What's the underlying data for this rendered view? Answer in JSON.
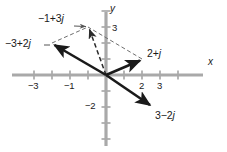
{
  "figure": {
    "axis_color": "#a8a8a8",
    "vector_color": "#1a1a1a",
    "dashed_color": "#6e6e6e",
    "text_color": "#1a1a1a"
  },
  "axes": {
    "x_label": "x",
    "y_label": "y",
    "origin_px": [
      106,
      75
    ],
    "unit_px_x": 18,
    "unit_px_y": 16,
    "xlim": [
      -4.7,
      5.2
    ],
    "ylim": [
      -4.4,
      4.2
    ],
    "x_ticks": [
      {
        "value": -4,
        "label": ""
      },
      {
        "value": -3,
        "label": "-3"
      },
      {
        "value": -2,
        "label": ""
      },
      {
        "value": -1,
        "label": "-1"
      },
      {
        "value": 1,
        "label": ""
      },
      {
        "value": 2,
        "label": "2"
      },
      {
        "value": 3,
        "label": "3"
      },
      {
        "value": 4,
        "label": ""
      }
    ],
    "y_ticks": [
      {
        "value": 4,
        "label": ""
      },
      {
        "value": 3,
        "label": "3"
      },
      {
        "value": 2,
        "label": ""
      },
      {
        "value": 1,
        "label": ""
      },
      {
        "value": -1,
        "label": ""
      },
      {
        "value": -2,
        "label": "-2"
      },
      {
        "value": -3,
        "label": ""
      },
      {
        "value": -4,
        "label": ""
      }
    ]
  },
  "chart_data": {
    "type": "scatter",
    "title": "",
    "xlabel": "x",
    "ylabel": "y",
    "xlim": [
      -4.7,
      5.2
    ],
    "ylim": [
      -4.4,
      4.2
    ],
    "grid": false,
    "legend": "none",
    "vectors": [
      {
        "name": "minus-3-plus-2j",
        "label": "-3+2j",
        "re": -3,
        "im": 2,
        "style": "solid",
        "label_pos": [
          6,
          40
        ]
      },
      {
        "name": "2-plus-j",
        "label": "2+j",
        "re": 2,
        "im": 1,
        "style": "solid",
        "label_pos": [
          148,
          49
        ]
      },
      {
        "name": "3-minus-2j",
        "label": "3-2j",
        "re": 3,
        "im": -2,
        "style": "solid",
        "label_pos": [
          155,
          112
        ]
      },
      {
        "name": "minus-1-plus-3j",
        "label": "-1+3j",
        "re": -1,
        "im": 3,
        "style": "dashed",
        "label_pos": [
          38,
          14
        ]
      }
    ],
    "construction_lines": [
      {
        "name": "parallelogram-edge-a",
        "from": [
          -3,
          2
        ],
        "to": [
          -1,
          3
        ],
        "style": "dashed"
      },
      {
        "name": "parallelogram-edge-b",
        "from": [
          2,
          1
        ],
        "to": [
          -1,
          3
        ],
        "style": "dashed"
      }
    ],
    "annotation": "Vector sum (-3+2j) + (2+j) = -1+3j shown by parallelogram construction"
  }
}
